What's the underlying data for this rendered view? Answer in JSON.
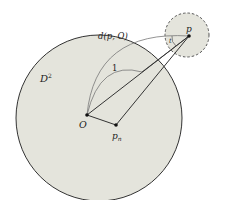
{
  "diagram": {
    "labels": {
      "disk": "D",
      "disk_sup": "2",
      "distance": "d(p, O)",
      "unit": "1",
      "origin": "O",
      "pn": "p",
      "pn_sub": "n",
      "p": "p",
      "t": "t"
    },
    "colors": {
      "disk_fill": "#e4e4dc",
      "stroke": "#333333",
      "arc": "#777777"
    }
  }
}
